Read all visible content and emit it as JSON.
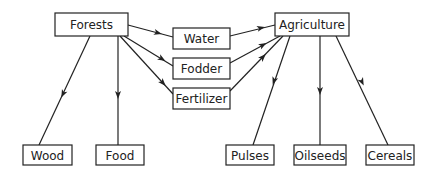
{
  "diagram": {
    "type": "flow",
    "nodes": {
      "forests": {
        "label": "Forests",
        "x": 55,
        "y": 13,
        "w": 73,
        "h": 23
      },
      "water": {
        "label": "Water",
        "x": 173,
        "y": 28,
        "w": 57,
        "h": 21
      },
      "fodder": {
        "label": "Fodder",
        "x": 173,
        "y": 58,
        "w": 57,
        "h": 21
      },
      "fertilizer": {
        "label": "Fertilizer",
        "x": 173,
        "y": 88,
        "w": 57,
        "h": 21
      },
      "agriculture": {
        "label": "Agriculture",
        "x": 275,
        "y": 13,
        "w": 74,
        "h": 23
      },
      "wood": {
        "label": "Wood",
        "x": 23,
        "y": 145,
        "w": 49,
        "h": 20
      },
      "food": {
        "label": "Food",
        "x": 96,
        "y": 145,
        "w": 48,
        "h": 20
      },
      "pulses": {
        "label": "Pulses",
        "x": 226,
        "y": 145,
        "w": 48,
        "h": 20
      },
      "oilseeds": {
        "label": "Oilseeds",
        "x": 294,
        "y": 145,
        "w": 52,
        "h": 20
      },
      "cereals": {
        "label": "Cereals",
        "x": 366,
        "y": 145,
        "w": 48,
        "h": 20
      }
    },
    "edges": [
      {
        "from": "forests",
        "to": "water",
        "x1": 128,
        "y1": 25,
        "x2": 173,
        "y2": 37,
        "ax": 158,
        "ay": 33
      },
      {
        "from": "forests",
        "to": "fodder",
        "x1": 124,
        "y1": 36,
        "x2": 173,
        "y2": 66,
        "ax": 162,
        "ay": 59
      },
      {
        "from": "forests",
        "to": "fertilizer",
        "x1": 120,
        "y1": 36,
        "x2": 173,
        "y2": 94,
        "ax": 163,
        "ay": 83
      },
      {
        "from": "water",
        "to": "agriculture",
        "x1": 230,
        "y1": 36,
        "x2": 275,
        "y2": 25,
        "ax": 261,
        "ay": 28
      },
      {
        "from": "fodder",
        "to": "agriculture",
        "x1": 230,
        "y1": 63,
        "x2": 280,
        "y2": 36,
        "ax": 263,
        "ay": 45
      },
      {
        "from": "fertilizer",
        "to": "agriculture",
        "x1": 230,
        "y1": 91,
        "x2": 283,
        "y2": 36,
        "ax": 263,
        "ay": 57
      },
      {
        "from": "forests",
        "to": "wood",
        "x1": 90,
        "y1": 36,
        "x2": 39,
        "y2": 145,
        "ax": 63,
        "ay": 94
      },
      {
        "from": "forests",
        "to": "food",
        "x1": 118,
        "y1": 36,
        "x2": 118,
        "y2": 145,
        "ax": 118,
        "ay": 95
      },
      {
        "from": "agriculture",
        "to": "pulses",
        "x1": 290,
        "y1": 36,
        "x2": 253,
        "y2": 145,
        "ax": 274,
        "ay": 81
      },
      {
        "from": "agriculture",
        "to": "oilseeds",
        "x1": 320,
        "y1": 36,
        "x2": 320,
        "y2": 145,
        "ax": 320,
        "ay": 91
      },
      {
        "from": "agriculture",
        "to": "cereals",
        "x1": 336,
        "y1": 36,
        "x2": 388,
        "y2": 145,
        "ax": 362,
        "ay": 82
      }
    ]
  }
}
